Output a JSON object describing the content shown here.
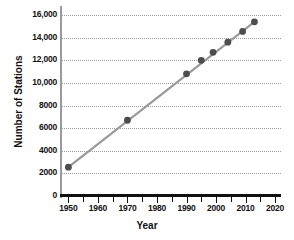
{
  "chart_data": {
    "type": "scatter",
    "title": "",
    "xlabel": "Year",
    "ylabel": "Number of Stations",
    "xlim": [
      1947.5,
      2022
    ],
    "ylim": [
      0,
      16800
    ],
    "grid": true,
    "legend": "none",
    "xticks": [
      1950,
      1960,
      1970,
      1980,
      1990,
      2000,
      2010,
      2020
    ],
    "xtick_labels": [
      "1950",
      "1960",
      "1970",
      "1980",
      "1990",
      "2000",
      "2010",
      "2020"
    ],
    "xminor_step": 5,
    "yticks": [
      0,
      2000,
      4000,
      6000,
      8000,
      10000,
      12000,
      14000,
      16000
    ],
    "ytick_labels": [
      "0",
      "2000",
      "4000",
      "6000",
      "8000",
      "10,000",
      "12,000",
      "14,000",
      "16,000"
    ],
    "x": [
      1950,
      1970,
      1990,
      1995,
      1999,
      2004,
      2009,
      2013
    ],
    "values": [
      2550,
      6700,
      10800,
      12000,
      12700,
      13600,
      14550,
      15400
    ],
    "series": [
      {
        "name": "Number of Stations",
        "x": [
          1950,
          1970,
          1990,
          1995,
          1999,
          2004,
          2009,
          2013
        ],
        "values": [
          2550,
          6700,
          10800,
          12000,
          12700,
          13600,
          14550,
          15400
        ]
      }
    ],
    "trend_line": {
      "x": [
        1950,
        2013
      ],
      "y": [
        2550,
        15400
      ]
    },
    "colors": {
      "marker": "#4d4d4d",
      "line": "#9a9a9a",
      "grid": "#9d9d9d",
      "axis": "#111111",
      "background": "#ffffff"
    },
    "marker_radius": 3.4
  }
}
